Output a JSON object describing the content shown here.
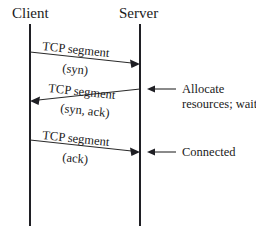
{
  "diagram": {
    "type": "sequence-diagram",
    "background_color": "#ffffff",
    "line_color": "#1f1f24",
    "text_color": "#1a1a1a",
    "participants": [
      {
        "id": "client",
        "label": "Client",
        "lifeline_x": 30,
        "label_x": 12,
        "label_y": 18
      },
      {
        "id": "server",
        "label": "Server",
        "lifeline_x": 140,
        "label_x": 119,
        "label_y": 18
      }
    ],
    "lifeline": {
      "y_top": 24,
      "y_bottom": 226
    },
    "messages": [
      {
        "id": "msg-syn",
        "direction": "client-to-server",
        "primary_label": "TCP segment",
        "secondary_label": "(syn)",
        "x1": 30,
        "y1": 52,
        "x2": 140,
        "y2": 64,
        "primary_label_x": 42,
        "primary_label_y": 50,
        "secondary_label_x": 62,
        "secondary_label_y": 72,
        "label_rotation": 6
      },
      {
        "id": "msg-syn-ack",
        "direction": "server-to-client",
        "primary_label": "TCP segment",
        "secondary_label": "(syn, ack)",
        "x1": 140,
        "y1": 89,
        "x2": 30,
        "y2": 101,
        "primary_label_x": 48,
        "primary_label_y": 92,
        "secondary_label_x": 60,
        "secondary_label_y": 112,
        "label_rotation": 6
      },
      {
        "id": "msg-ack",
        "direction": "client-to-server",
        "primary_label": "TCP segment",
        "secondary_label": "(ack)",
        "x1": 30,
        "y1": 140,
        "x2": 140,
        "y2": 152,
        "primary_label_x": 42,
        "primary_label_y": 139,
        "secondary_label_x": 62,
        "secondary_label_y": 161,
        "label_rotation": 6
      }
    ],
    "notes": [
      {
        "id": "note-allocate",
        "arrow_from_x": 176,
        "arrow_to_x": 148,
        "arrow_y": 89,
        "lines": [
          "Allocate",
          "resources; wait"
        ],
        "text_x": 182,
        "text_y": 93,
        "line_height": 15
      },
      {
        "id": "note-connected",
        "arrow_from_x": 176,
        "arrow_to_x": 148,
        "arrow_y": 152,
        "lines": [
          "Connected"
        ],
        "text_x": 182,
        "text_y": 156,
        "line_height": 15
      }
    ]
  }
}
